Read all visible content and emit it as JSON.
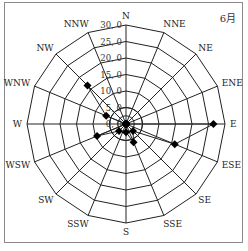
{
  "chart_data": {
    "type": "radar",
    "title": "6月",
    "categories": [
      "N",
      "NNE",
      "NE",
      "ENE",
      "E",
      "ESE",
      "SE",
      "SSE",
      "S",
      "SSW",
      "SW",
      "WSW",
      "W",
      "WNW",
      "NW",
      "NNW"
    ],
    "series": [
      {
        "name": "6月",
        "values": [
          0,
          0,
          0,
          0,
          26.5,
          16.0,
          3.0,
          6.0,
          2.5,
          0,
          3.0,
          9.5,
          0,
          6.5,
          16.5,
          0
        ]
      }
    ],
    "radial_ticks": [
      "0.0",
      "5.0",
      "10.0",
      "15.0",
      "20.0",
      "25.0",
      "30.0"
    ],
    "rlim": [
      0,
      30
    ],
    "grid": true,
    "line_color": "#222222",
    "marker": "diamond"
  },
  "labels": {
    "month": "6月"
  }
}
